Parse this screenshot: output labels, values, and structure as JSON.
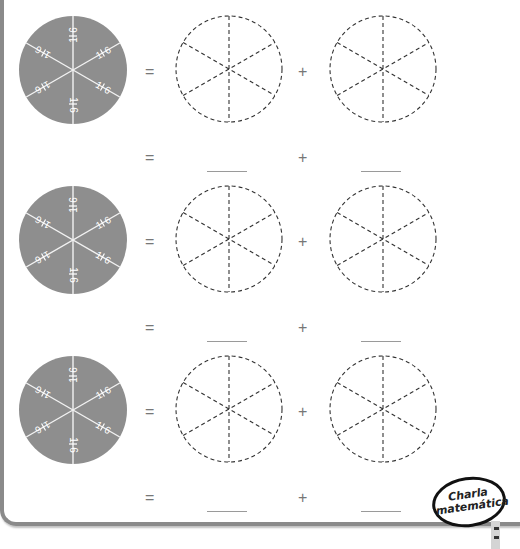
{
  "page": {
    "colors": {
      "pie_fill": "#8e8e8e",
      "pie_lines": "#f2f2f2",
      "dash": "#333333",
      "blank_line": "#9a9a9a",
      "frame": "#8a8a8a"
    }
  },
  "exercises": [
    {
      "pie": {
        "slices": 6,
        "labels": [
          "1/6",
          "1/6",
          "1/6",
          "1/6",
          "1/6",
          "1/6"
        ]
      },
      "equals_1": "=",
      "plus_1": "+",
      "equals_2": "=",
      "plus_2": "+",
      "blank_left": "",
      "blank_right": ""
    },
    {
      "pie": {
        "slices": 6,
        "labels": [
          "1/6",
          "1/6",
          "1/6",
          "1/6",
          "1/6",
          "1/6"
        ]
      },
      "equals_1": "=",
      "plus_1": "+",
      "equals_2": "=",
      "plus_2": "+",
      "blank_left": "",
      "blank_right": ""
    },
    {
      "pie": {
        "slices": 6,
        "labels": [
          "1/6",
          "1/6",
          "1/6",
          "1/6",
          "1/6",
          "1/6"
        ]
      },
      "equals_1": "=",
      "plus_1": "+",
      "equals_2": "=",
      "plus_2": "+",
      "blank_left": "",
      "blank_right": ""
    }
  ],
  "badge": {
    "line1": "Charla",
    "line2": "matemática"
  }
}
